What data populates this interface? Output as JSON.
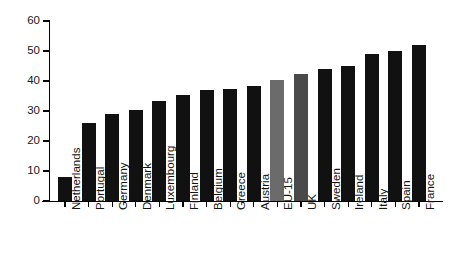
{
  "chart_data": {
    "type": "bar",
    "title": "",
    "xlabel": "",
    "ylabel": "Percent (%)",
    "ylim": [
      0,
      60
    ],
    "yticks": [
      0,
      10,
      20,
      30,
      40,
      50,
      60
    ],
    "grid": false,
    "legend": "none",
    "categories": [
      "Netherlands",
      "Portugal",
      "Germany",
      "Denmark",
      "Luxembourg",
      "Finland",
      "Belgium",
      "Greece",
      "Austria",
      "EU-15",
      "UK",
      "Sweden",
      "Ireland",
      "Italy",
      "Spain",
      "France"
    ],
    "values": [
      8,
      26,
      29,
      30.5,
      33.5,
      35.5,
      37,
      37.3,
      38.5,
      40.5,
      42.5,
      44,
      45,
      49,
      50,
      52
    ],
    "bar_colors": [
      "#111111",
      "#111111",
      "#111111",
      "#111111",
      "#111111",
      "#111111",
      "#111111",
      "#111111",
      "#111111",
      "#6b6b6b",
      "#4a4a4a",
      "#111111",
      "#111111",
      "#111111",
      "#111111",
      "#111111"
    ],
    "highlight_colors": {
      "default_bar": "#111111",
      "eu15_bar": "#6b6b6b",
      "uk_bar": "#4a4a4a",
      "axis": "#000000",
      "text": "#1a1a1a",
      "background": "#ffffff"
    }
  }
}
